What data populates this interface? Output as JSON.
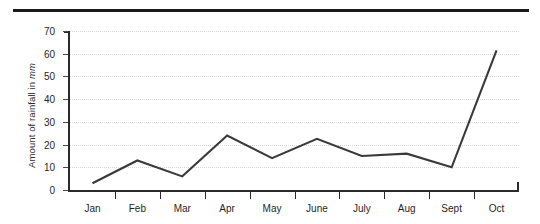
{
  "chart_data": {
    "type": "line",
    "title": "",
    "xlabel": "",
    "ylabel": "Amount of rainfall in mm",
    "ylabel_prefix": "Amount of rainfall in ",
    "ylabel_unit": "mm",
    "categories": [
      "Jan",
      "Feb",
      "Mar",
      "Apr",
      "May",
      "June",
      "July",
      "Aug",
      "Sept",
      "Oct"
    ],
    "values": [
      3,
      13,
      6,
      24,
      14,
      22.5,
      15,
      16,
      10,
      61.5
    ],
    "series": [
      {
        "name": "Amount of rainfall",
        "values": [
          3,
          13,
          6,
          24,
          14,
          22.5,
          15,
          16,
          10,
          61.5
        ]
      }
    ],
    "ylim": [
      0,
      70
    ],
    "y_ticks": [
      0,
      10,
      20,
      30,
      40,
      50,
      60,
      70
    ],
    "y_tick_labels": [
      "0",
      "10",
      "20",
      "30",
      "40",
      "50",
      "60",
      "70"
    ],
    "grid": true,
    "grid_style": "dotted-horizontal",
    "legend": "none",
    "line_color": "#3a3a3a",
    "grid_color": "#d8d8dc",
    "axis_color": "#2a2a2a",
    "background_color": "#ffffff"
  },
  "decor": {
    "top_rule_color": "#1a1a1a"
  }
}
